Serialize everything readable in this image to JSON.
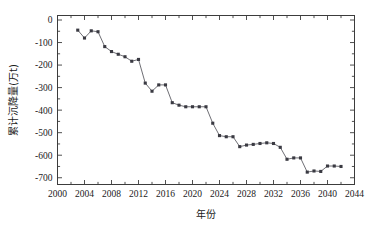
{
  "chart_data": {
    "type": "line",
    "title": "",
    "subtitle": "",
    "xlabel": "年份",
    "ylabel": "累计沉降量(万t)",
    "xlim": [
      2000,
      2044
    ],
    "ylim": [
      -730,
      20
    ],
    "grid": false,
    "legend": null,
    "legend_position": "none",
    "xticks": [
      2000,
      2004,
      2008,
      2012,
      2016,
      2020,
      2024,
      2028,
      2032,
      2036,
      2040,
      2044
    ],
    "xtick_labels": [
      "2000",
      "2004",
      "2008",
      "2012",
      "2016",
      "2020",
      "2024",
      "2028",
      "2032",
      "2036",
      "2040",
      "2044"
    ],
    "xminor_step": 2,
    "yticks": [
      0,
      -100,
      -200,
      -300,
      -400,
      -500,
      -600,
      -700
    ],
    "ytick_labels": [
      "0",
      "-100",
      "-200",
      "-300",
      "-400",
      "-500",
      "-600",
      "-700"
    ],
    "yminor_step": 50,
    "marker": "square",
    "marker_color": "#3a3a42",
    "line_color": "#55555c",
    "series": [
      {
        "name": "累计沉降量",
        "x": [
          2003,
          2004,
          2005,
          2006,
          2007,
          2008,
          2009,
          2010,
          2011,
          2012,
          2013,
          2014,
          2015,
          2016,
          2017,
          2018,
          2019,
          2020,
          2021,
          2022,
          2023,
          2024,
          2025,
          2026,
          2027,
          2028,
          2029,
          2030,
          2031,
          2032,
          2033,
          2034,
          2035,
          2036,
          2037,
          2038,
          2039,
          2040,
          2041,
          2042
        ],
        "values": [
          -45,
          -80,
          -48,
          -52,
          -118,
          -140,
          -152,
          -163,
          -183,
          -175,
          -280,
          -316,
          -288,
          -288,
          -367,
          -378,
          -385,
          -385,
          -385,
          -385,
          -458,
          -513,
          -518,
          -518,
          -562,
          -555,
          -552,
          -548,
          -545,
          -548,
          -565,
          -618,
          -612,
          -612,
          -675,
          -670,
          -672,
          -648,
          -648,
          -650
        ]
      }
    ]
  }
}
